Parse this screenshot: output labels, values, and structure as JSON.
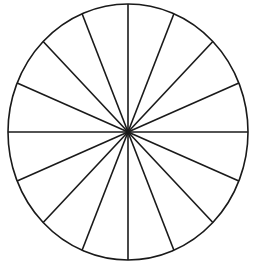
{
  "figure": {
    "name": "fraction-circle",
    "kind": "geometric-diagram",
    "background_color": "#ffffff",
    "stroke_color": "#1a1a1a",
    "stroke_width": 1.6,
    "center": {
      "x": 128,
      "y": 132
    },
    "radius_x": 120,
    "radius_y": 128,
    "sector_count": 16,
    "sector_angle_degrees": 22.5,
    "diameter_count": 8,
    "center_dot_radius": 2.2,
    "labels": [],
    "divider_angles_degrees": [
      0,
      22.5,
      45,
      67.5,
      90,
      112.5,
      135,
      157.5
    ]
  },
  "chart_data": {
    "type": "pie",
    "title": "",
    "xlabel": "",
    "ylabel": "",
    "categories": [
      "sector-1",
      "sector-2",
      "sector-3",
      "sector-4",
      "sector-5",
      "sector-6",
      "sector-7",
      "sector-8",
      "sector-9",
      "sector-10",
      "sector-11",
      "sector-12",
      "sector-13",
      "sector-14",
      "sector-15",
      "sector-16"
    ],
    "values": [
      6.25,
      6.25,
      6.25,
      6.25,
      6.25,
      6.25,
      6.25,
      6.25,
      6.25,
      6.25,
      6.25,
      6.25,
      6.25,
      6.25,
      6.25,
      6.25
    ],
    "value_unit": "percent",
    "slice_fill": "#ffffff",
    "slice_stroke": "#1a1a1a",
    "legend": [],
    "legend_position": "none",
    "grid": false,
    "shaded_count": 0,
    "total_slices": 16
  }
}
